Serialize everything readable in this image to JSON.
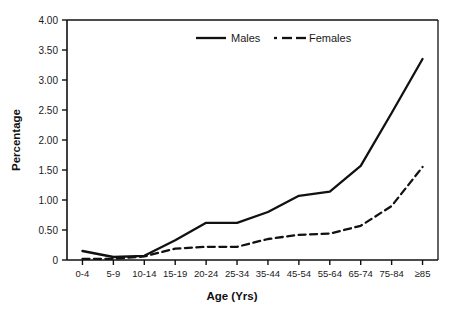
{
  "chart_data": {
    "type": "line",
    "title": "",
    "xlabel": "Age (Yrs)",
    "ylabel": "Percentage",
    "categories": [
      "0-4",
      "5-9",
      "10-14",
      "15-19",
      "20-24",
      "25-34",
      "35-44",
      "45-54",
      "55-64",
      "65-74",
      "75-84",
      "≥85"
    ],
    "series": [
      {
        "name": "Males",
        "style": "solid",
        "color": "#111111",
        "values": [
          0.15,
          0.05,
          0.07,
          0.33,
          0.62,
          0.62,
          0.8,
          1.07,
          1.14,
          1.57,
          2.45,
          3.35
        ]
      },
      {
        "name": "Females",
        "style": "dashed",
        "color": "#111111",
        "values": [
          0.02,
          0.02,
          0.06,
          0.19,
          0.22,
          0.22,
          0.35,
          0.42,
          0.44,
          0.57,
          0.9,
          1.55
        ]
      }
    ],
    "ylim": [
      0,
      4.0
    ],
    "ytick_values": [
      0,
      0.5,
      1.0,
      1.5,
      2.0,
      2.5,
      3.0,
      3.5,
      4.0
    ],
    "ytick_labels": [
      "0",
      "0.50",
      "1.00",
      "1.50",
      "2.00",
      "2.50",
      "3.00",
      "3.50",
      "4.00"
    ],
    "grid": false,
    "legend_position": "top-center",
    "legend": [
      "Males",
      "Females"
    ]
  },
  "axes": {
    "y_title": "Percentage",
    "x_title": "Age (Yrs)"
  },
  "legend": {
    "males_label": "Males",
    "females_label": "Females"
  }
}
